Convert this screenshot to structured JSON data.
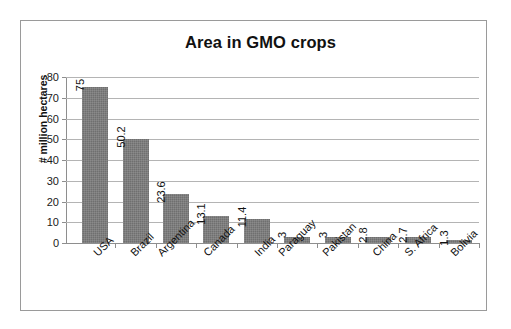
{
  "chart_data": {
    "type": "bar",
    "title": "Area in GMO crops",
    "xlabel": "",
    "ylabel": "# million hectares",
    "categories": [
      "USA",
      "Brazil",
      "Argentina",
      "Canada",
      "India",
      "Paraguay",
      "Pakistan",
      "China",
      "S. Africa",
      "Bolivia"
    ],
    "values": [
      75,
      50.2,
      23.6,
      13.1,
      11.4,
      3,
      3,
      2.8,
      2.7,
      1.3
    ],
    "value_labels": [
      "75",
      "50.2",
      "23.6",
      "13.1",
      "11.4",
      "3",
      "3",
      "2.8",
      "2.7",
      "1.3"
    ],
    "ylim": [
      0,
      80
    ],
    "y_ticks": [
      0,
      10,
      20,
      30,
      40,
      50,
      60,
      70,
      80
    ],
    "y_tick_labels": [
      "0",
      "10",
      "20",
      "30",
      "40",
      "50",
      "60",
      "70",
      "80"
    ],
    "grid": true,
    "legend": false,
    "bar_color": "#6f6f6f",
    "gridline_color": "#b4b4b4",
    "axis_color": "#8e8e8e",
    "text_color": "#111111",
    "background_color": "#ffffff",
    "frame_border_color": "#9a9a9a"
  }
}
